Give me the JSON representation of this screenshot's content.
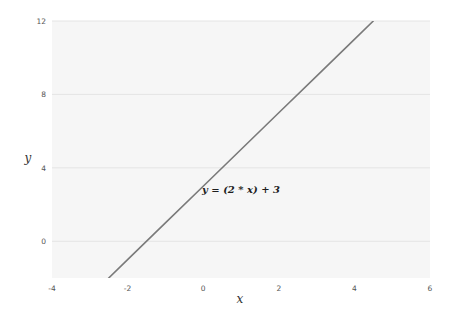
{
  "chart_data": {
    "type": "line",
    "title": "",
    "xlabel": "x",
    "ylabel": "y",
    "xlim": [
      -4,
      6
    ],
    "ylim": [
      -2,
      12
    ],
    "xticks": [
      -4,
      -2,
      0,
      2,
      4,
      6
    ],
    "yticks": [
      0,
      4,
      8,
      12
    ],
    "grid": {
      "horizontal": true,
      "vertical": false
    },
    "legend": null,
    "series": [
      {
        "name": "y = (2 * x) + 3",
        "x": [
          -2.5,
          -2,
          -1,
          0,
          1,
          2,
          3,
          4,
          4.5
        ],
        "y": [
          -2,
          -1,
          1,
          3,
          5,
          7,
          9,
          11,
          12
        ],
        "color": "#7a7a7a"
      }
    ],
    "annotations": [
      {
        "text": "y = (2 * x) + 3",
        "x": 1.0,
        "y": 2.8
      }
    ]
  },
  "colors": {
    "background": "#ffffff",
    "plot_background": "#f6f6f6",
    "gridline": "#e4e4e4",
    "line": "#7a7a7a",
    "tick_text": "#555555"
  },
  "layout": {
    "plot": {
      "left": 52,
      "top": 21,
      "right": 430,
      "bottom": 278
    },
    "xlabel_pos": {
      "x": 240,
      "y": 303
    },
    "ylabel_pos": {
      "x": 28,
      "y": 162
    }
  }
}
